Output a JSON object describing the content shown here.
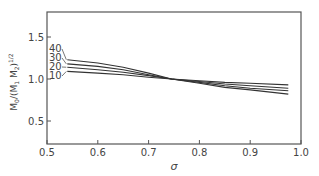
{
  "chart_data": {
    "type": "line",
    "title": "",
    "xlabel": "σ",
    "ylabel": "M₀/(M₁M₂)^1/2",
    "xlim": [
      0.5,
      1.0
    ],
    "ylim": [
      0.23,
      1.8
    ],
    "grid": false,
    "legend_position": "inline-left",
    "x_ticks": [
      0.5,
      0.6,
      0.7,
      0.8,
      0.9,
      1.0
    ],
    "x_tick_labels": [
      "0.5",
      "0.6",
      "0.7",
      "0.8",
      "0.9",
      "1.0"
    ],
    "y_ticks": [
      0.5,
      1.0,
      1.5
    ],
    "y_tick_labels": [
      "0.5",
      "1.0",
      "1.5"
    ],
    "x": [
      0.54,
      0.6,
      0.65,
      0.7,
      0.745,
      0.8,
      0.85,
      0.9,
      0.975
    ],
    "series": [
      {
        "name": "40",
        "values": [
          1.23,
          1.19,
          1.14,
          1.07,
          1.0,
          0.95,
          0.9,
          0.87,
          0.82
        ]
      },
      {
        "name": "30",
        "values": [
          1.18,
          1.15,
          1.11,
          1.05,
          1.0,
          0.96,
          0.92,
          0.89,
          0.86
        ]
      },
      {
        "name": "20",
        "values": [
          1.14,
          1.11,
          1.08,
          1.04,
          1.0,
          0.97,
          0.94,
          0.92,
          0.89
        ]
      },
      {
        "name": "10",
        "values": [
          1.09,
          1.07,
          1.05,
          1.02,
          1.0,
          0.98,
          0.96,
          0.95,
          0.93
        ]
      }
    ],
    "annotations": [
      "40",
      "30",
      "20",
      "10"
    ]
  },
  "labels": {
    "x_title": "σ",
    "y_title_main": "M",
    "y_title_sub0": "0",
    "y_title_mid": "/(M",
    "y_title_sub1": "1",
    "y_title_sep": " M",
    "y_title_sub2": "2",
    "y_title_end": ")",
    "y_title_sup": "1/2"
  }
}
